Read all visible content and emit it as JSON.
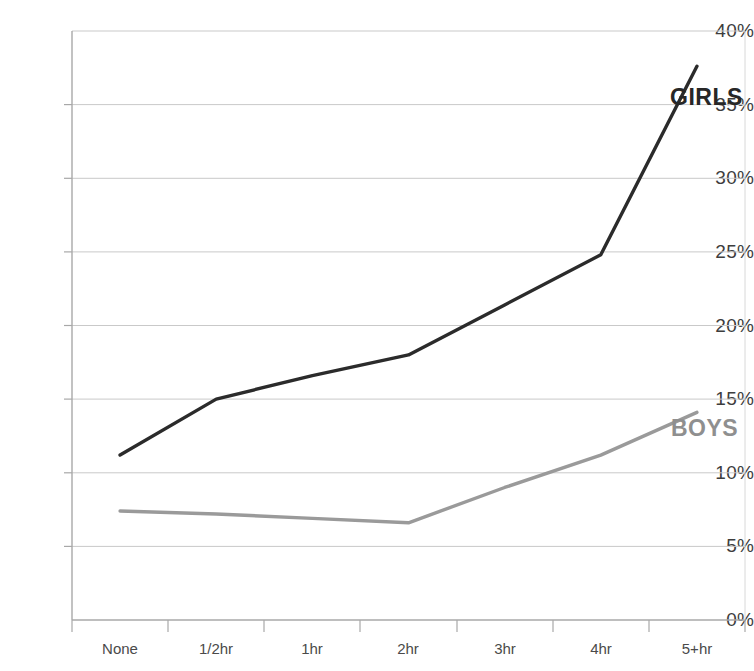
{
  "chart_data": {
    "type": "line",
    "title": "",
    "subtitle": "",
    "xlabel": "",
    "ylabel": "",
    "categories": [
      "None",
      "1/2hr",
      "1hr",
      "2hr",
      "3hr",
      "4hr",
      "5+hr"
    ],
    "ylim": [
      0,
      40
    ],
    "ytick_values": [
      0,
      5,
      10,
      15,
      20,
      25,
      30,
      35,
      40
    ],
    "ytick_labels": [
      "0%",
      "5%",
      "10%",
      "15%",
      "20%",
      "25%",
      "30%",
      "35%",
      "40%"
    ],
    "grid": "horizontal",
    "legend_position": "inline-right-of-line-ends",
    "series": [
      {
        "name": "GIRLS",
        "color": "#2b2b2b",
        "values": [
          11.2,
          15.0,
          16.6,
          18.0,
          21.4,
          24.8,
          37.6
        ]
      },
      {
        "name": "BOYS",
        "color": "#9a9a9a",
        "values": [
          7.4,
          7.2,
          6.9,
          6.6,
          9.0,
          11.2,
          14.1
        ]
      }
    ],
    "annotations": [
      {
        "text": "GIRLS",
        "series": "GIRLS",
        "color": "#272727"
      },
      {
        "text": "BOYS",
        "series": "BOYS",
        "color": "#8f8f8f"
      }
    ],
    "colors": {
      "girls": "#2b2b2b",
      "boys": "#9a9a9a",
      "gridline": "#c9c9c9",
      "axis": "#b0b0b0",
      "background": "#ffffff",
      "tick_text": "#3d3d3d"
    }
  }
}
